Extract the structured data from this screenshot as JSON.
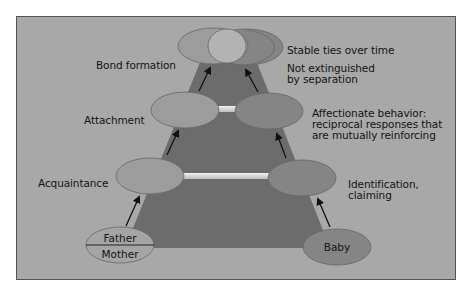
{
  "diagram": {
    "type": "attachment-pyramid",
    "colors": {
      "background": "#a8a8a8",
      "pyramid": "#6e6e6e",
      "oval_left": "#9a9a9a",
      "oval_right": "#848484",
      "connector": "#dcdcdc"
    },
    "stages": [
      {
        "label": "Bond formation",
        "description_lines": [
          "Stable ties over time",
          "Not extinguished",
          "by separation"
        ]
      },
      {
        "label": "Attachment",
        "description_lines": [
          "Affectionate behavior:",
          "reciprocal responses that",
          "are mutually reinforcing"
        ]
      },
      {
        "label": "Acquaintance",
        "description_lines": [
          "Identification,",
          "claiming"
        ]
      }
    ],
    "parents": {
      "top": "Father",
      "bottom": "Mother"
    },
    "child": "Baby"
  }
}
